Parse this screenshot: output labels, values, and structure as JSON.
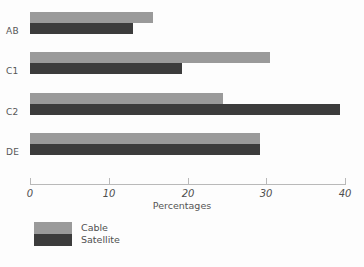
{
  "chart_data": {
    "type": "bar",
    "orientation": "horizontal",
    "title": "",
    "xlabel": "Percentages",
    "ylabel": "",
    "categories": [
      "AB",
      "C1",
      "C2",
      "DE"
    ],
    "series": [
      {
        "name": "Cable",
        "color": "#9a9a9a",
        "values": [
          15.6,
          30.5,
          24.5,
          29.2
        ]
      },
      {
        "name": "Satellite",
        "color": "#3c3c3c",
        "values": [
          13.1,
          19.3,
          39.4,
          29.2
        ]
      }
    ],
    "xlim": [
      0,
      40
    ],
    "xticks": [
      0,
      10,
      20,
      30,
      40
    ],
    "xtick_labels": [
      "0",
      "10",
      "20",
      "30",
      "40"
    ],
    "grid": false,
    "legend_position": "bottom-left",
    "background_color": "#fdfdfd"
  },
  "legend": {
    "entries": [
      {
        "label": "Cable",
        "color": "#9a9a9a"
      },
      {
        "label": "Satellite",
        "color": "#3c3c3c"
      }
    ]
  }
}
